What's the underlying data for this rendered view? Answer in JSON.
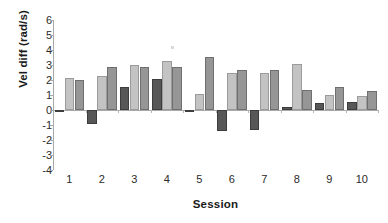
{
  "chart_data": {
    "type": "bar",
    "title": "",
    "xlabel": "Session",
    "ylabel": "Vel diff (rad/s)",
    "categories": [
      "1",
      "2",
      "3",
      "4",
      "5",
      "6",
      "7",
      "8",
      "9",
      "10"
    ],
    "ylim": [
      -4,
      6
    ],
    "ytick_labels": [
      "6",
      "5",
      "4",
      "3",
      "2",
      "1",
      "0",
      "-1",
      "-2",
      "-3",
      "-4"
    ],
    "ytick_values": [
      6,
      5,
      4,
      3,
      2,
      1,
      0,
      -1,
      -2,
      -3,
      -4
    ],
    "grid": false,
    "legend": "none",
    "series": [
      {
        "name": "series-1",
        "color": "#575757",
        "values": [
          -0.05,
          -0.95,
          1.55,
          2.05,
          -0.1,
          -1.4,
          -1.35,
          0.2,
          0.45,
          0.55
        ]
      },
      {
        "name": "series-2",
        "color": "#c3c3c3",
        "values": [
          2.15,
          2.3,
          2.97,
          3.3,
          1.05,
          2.5,
          2.5,
          3.1,
          1.0,
          0.95
        ]
      },
      {
        "name": "series-3",
        "color": "#969696",
        "values": [
          2.02,
          2.9,
          2.85,
          2.85,
          3.55,
          2.65,
          2.7,
          1.35,
          1.55,
          1.25
        ]
      }
    ]
  }
}
